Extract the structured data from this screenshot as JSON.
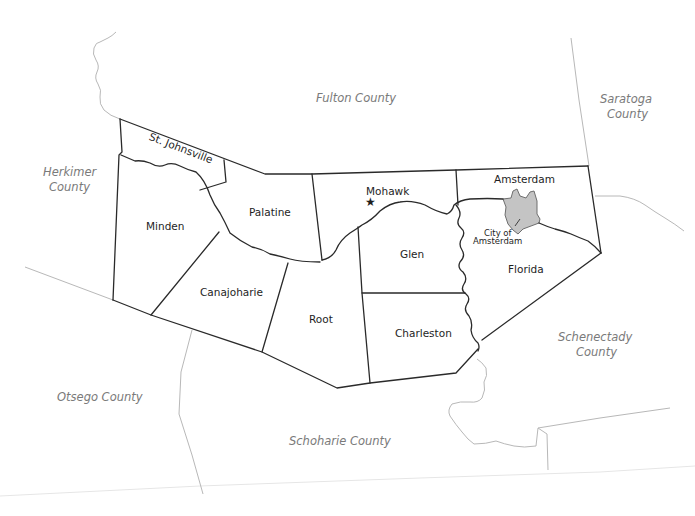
{
  "map": {
    "title": "Montgomery County towns",
    "colors": {
      "town_border": "#2a2a2a",
      "county_border": "#b8b8b8",
      "city_fill": "#c4c4c4",
      "county_label": "#7a7a7a",
      "town_label": "#1e1e1e",
      "background": "#ffffff"
    },
    "neighboring_counties": [
      {
        "name": "Fulton County",
        "lines": [
          "Fulton County"
        ]
      },
      {
        "name": "Saratoga County",
        "lines": [
          "Saratoga",
          "County"
        ]
      },
      {
        "name": "Herkimer County",
        "lines": [
          "Herkimer",
          "County"
        ]
      },
      {
        "name": "Schenectady County",
        "lines": [
          "Schenectady",
          "County"
        ]
      },
      {
        "name": "Otsego County",
        "lines": [
          "Otsego County"
        ]
      },
      {
        "name": "Schoharie County",
        "lines": [
          "Schoharie County"
        ]
      }
    ],
    "towns": [
      {
        "name": "St. Johnsville"
      },
      {
        "name": "Minden"
      },
      {
        "name": "Palatine"
      },
      {
        "name": "Canajoharie"
      },
      {
        "name": "Root"
      },
      {
        "name": "Mohawk"
      },
      {
        "name": "Glen"
      },
      {
        "name": "Charleston"
      },
      {
        "name": "Amsterdam"
      },
      {
        "name": "Florida"
      }
    ],
    "city": {
      "name": "City of Amsterdam",
      "lines": [
        "City of",
        "Amsterdam"
      ]
    },
    "seat_marker": {
      "symbol": "★",
      "town": "Mohawk",
      "icon": "star-icon"
    }
  }
}
